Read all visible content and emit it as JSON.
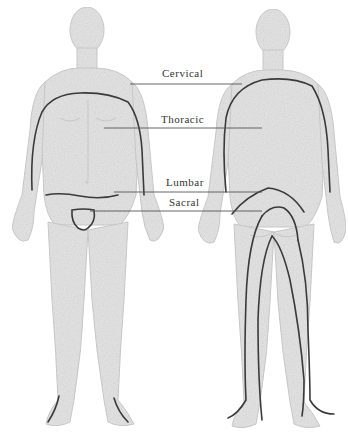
{
  "diagram": {
    "type": "anatomical-regions",
    "views": [
      "front",
      "back"
    ],
    "labels": [
      {
        "id": "cervical",
        "text": "Cervical",
        "x": 162,
        "y": 67
      },
      {
        "id": "thoracic",
        "text": "Thoracic",
        "x": 161,
        "y": 113
      },
      {
        "id": "lumbar",
        "text": "Lumbar",
        "x": 166,
        "y": 176
      },
      {
        "id": "sacral",
        "text": "Sacral",
        "x": 169,
        "y": 196
      }
    ],
    "colors": {
      "body_fill": "#e4e4e4",
      "body_stroke": "#c8c8c8",
      "region_line": "#3a3a3a",
      "leader_line": "#555555",
      "text": "#333333"
    }
  }
}
